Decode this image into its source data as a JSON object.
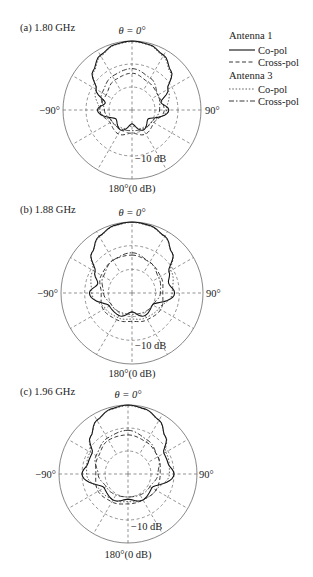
{
  "legend": {
    "groups": [
      {
        "title": "Antenna 1",
        "entries": [
          {
            "label": "Co-pol",
            "style": "solid"
          },
          {
            "label": "Cross-pol",
            "style": "dashed"
          }
        ]
      },
      {
        "title": "Antenna 3",
        "entries": [
          {
            "label": "Co-pol",
            "style": "dotted"
          },
          {
            "label": "Cross-pol",
            "style": "dash-dot"
          }
        ]
      }
    ]
  },
  "panels": [
    {
      "label": "(a) 1.80 GHz",
      "top_label": "θ = 0°",
      "left_label": "−90°",
      "right_label": "90°",
      "ring_label": "−10 dB",
      "bottom_label": "180°(0 dB)"
    },
    {
      "label": "(b) 1.88 GHz",
      "top_label": "θ = 0°",
      "left_label": "−90°",
      "right_label": "90°",
      "ring_label": "−10 dB",
      "bottom_label": "180°(0 dB)"
    },
    {
      "label": "(c) 1.96 GHz",
      "top_label": "θ = 0°",
      "left_label": "−90°",
      "right_label": "90°",
      "ring_label": "−10 dB",
      "bottom_label": "180°(0 dB)"
    }
  ],
  "chart_data": [
    {
      "type": "polar-line",
      "title": "(a) 1.80 GHz",
      "angular_axis": {
        "zero": "θ = 0° (top)",
        "ticks": [
          "0°",
          "90°",
          "180°",
          "−90°"
        ],
        "direction": "clockwise"
      },
      "radial_axis": {
        "unit": "dB",
        "outer": 0,
        "ring_labels": [
          "−10 dB"
        ],
        "rings_db": [
          0,
          -10,
          -20
        ]
      },
      "grid": true,
      "series": [
        {
          "name": "Antenna 1 Co-pol",
          "style": "solid",
          "angles_deg": [
            0,
            15,
            30,
            45,
            60,
            75,
            90,
            120,
            150,
            180,
            -150,
            -120,
            -90,
            -75,
            -60,
            -45,
            -30,
            -15
          ],
          "values_db": [
            0,
            -0.6,
            -2.5,
            -6,
            -12,
            -17,
            -14,
            -22,
            -20,
            -24,
            -20,
            -22,
            -15,
            -18,
            -12,
            -6,
            -2.5,
            -0.6
          ]
        },
        {
          "name": "Antenna 1 Cross-pol",
          "style": "dashed",
          "angles_deg": [
            0,
            30,
            60,
            90,
            120,
            150,
            180,
            -150,
            -120,
            -90,
            -60,
            -30
          ],
          "values_db": [
            -14,
            -16,
            -17,
            -16,
            -19,
            -18,
            -20,
            -18,
            -19,
            -16,
            -17,
            -15
          ]
        },
        {
          "name": "Antenna 3 Co-pol",
          "style": "dotted",
          "angles_deg": [
            0,
            15,
            30,
            45,
            60,
            90,
            120,
            150,
            180,
            -150,
            -120,
            -90,
            -60,
            -45,
            -30,
            -15
          ],
          "values_db": [
            -0.3,
            -0.8,
            -3,
            -6.5,
            -12,
            -15,
            -20,
            -21,
            -23,
            -21,
            -20,
            -16,
            -12,
            -6.5,
            -3,
            -0.8
          ]
        },
        {
          "name": "Antenna 3 Cross-pol",
          "style": "dash-dot",
          "angles_deg": [
            0,
            30,
            60,
            90,
            120,
            180,
            -120,
            -90,
            -60,
            -30
          ],
          "values_db": [
            -12,
            -14,
            -17,
            -18,
            -20,
            -21,
            -20,
            -18,
            -15,
            -13
          ]
        }
      ]
    },
    {
      "type": "polar-line",
      "title": "(b) 1.88 GHz",
      "angular_axis": {
        "zero": "θ = 0° (top)",
        "ticks": [
          "0°",
          "90°",
          "180°",
          "−90°"
        ],
        "direction": "clockwise"
      },
      "radial_axis": {
        "unit": "dB",
        "outer": 0,
        "ring_labels": [
          "−10 dB"
        ],
        "rings_db": [
          0,
          -10,
          -20
        ]
      },
      "grid": true,
      "series": [
        {
          "name": "Antenna 1 Co-pol",
          "style": "solid",
          "angles_deg": [
            0,
            15,
            30,
            45,
            60,
            75,
            90,
            120,
            150,
            180,
            -150,
            -120,
            -90,
            -75,
            -60,
            -45,
            -30,
            -15
          ],
          "values_db": [
            0,
            -0.5,
            -2.3,
            -6,
            -12,
            -14,
            -12,
            -20,
            -19,
            -22,
            -19,
            -19,
            -12,
            -15,
            -12,
            -6,
            -2.3,
            -0.5
          ]
        },
        {
          "name": "Antenna 1 Cross-pol",
          "style": "dashed",
          "angles_deg": [
            0,
            30,
            60,
            90,
            120,
            150,
            180,
            -150,
            -120,
            -90,
            -60,
            -30
          ],
          "values_db": [
            -14,
            -15,
            -16,
            -17,
            -16,
            -17,
            -18,
            -17,
            -16,
            -17,
            -15,
            -14
          ]
        },
        {
          "name": "Antenna 3 Co-pol",
          "style": "dotted",
          "angles_deg": [
            0,
            15,
            30,
            45,
            60,
            90,
            120,
            150,
            180,
            -150,
            -120,
            -90,
            -60,
            -45,
            -30,
            -15
          ],
          "values_db": [
            -0.2,
            -0.7,
            -2.6,
            -6,
            -11,
            -13,
            -17,
            -18,
            -19,
            -18,
            -17,
            -13,
            -11,
            -6,
            -2.6,
            -0.7
          ]
        },
        {
          "name": "Antenna 3 Cross-pol",
          "style": "dash-dot",
          "angles_deg": [
            0,
            30,
            60,
            90,
            120,
            180,
            -120,
            -90,
            -60,
            -30
          ],
          "values_db": [
            -13,
            -15,
            -17,
            -18,
            -20,
            -21,
            -20,
            -18,
            -16,
            -14
          ]
        }
      ]
    },
    {
      "type": "polar-line",
      "title": "(c) 1.96 GHz",
      "angular_axis": {
        "zero": "θ = 0° (top)",
        "ticks": [
          "0°",
          "90°",
          "180°",
          "−90°"
        ],
        "direction": "clockwise"
      },
      "radial_axis": {
        "unit": "dB",
        "outer": 0,
        "ring_labels": [
          "−10 dB"
        ],
        "rings_db": [
          0,
          -10,
          -20
        ]
      },
      "grid": true,
      "series": [
        {
          "name": "Antenna 1 Co-pol",
          "style": "solid",
          "angles_deg": [
            0,
            15,
            30,
            45,
            60,
            75,
            90,
            120,
            150,
            180,
            -150,
            -120,
            -90,
            -75,
            -60,
            -45,
            -30,
            -15
          ],
          "values_db": [
            0,
            -0.8,
            -3,
            -7,
            -12,
            -12,
            -10,
            -18,
            -17,
            -19,
            -17,
            -18,
            -10,
            -12,
            -12,
            -7,
            -3,
            -0.8
          ]
        },
        {
          "name": "Antenna 1 Cross-pol",
          "style": "dashed",
          "angles_deg": [
            0,
            30,
            60,
            90,
            120,
            150,
            180,
            -150,
            -120,
            -90,
            -60,
            -30
          ],
          "values_db": [
            -13,
            -14,
            -15,
            -16,
            -16,
            -17,
            -17,
            -16,
            -15,
            -16,
            -15,
            -13
          ]
        },
        {
          "name": "Antenna 3 Co-pol",
          "style": "dotted",
          "angles_deg": [
            0,
            15,
            30,
            45,
            60,
            90,
            120,
            150,
            180,
            -150,
            -120,
            -90,
            -60,
            -45,
            -30,
            -15
          ],
          "values_db": [
            -0.3,
            -1,
            -3.2,
            -7,
            -11,
            -12,
            -16,
            -17,
            -18,
            -17,
            -16,
            -12,
            -11,
            -7,
            -3.2,
            -1
          ]
        },
        {
          "name": "Antenna 3 Cross-pol",
          "style": "dash-dot",
          "angles_deg": [
            0,
            30,
            60,
            90,
            120,
            180,
            -120,
            -90,
            -60,
            -30
          ],
          "values_db": [
            -11,
            -13,
            -15,
            -17,
            -19,
            -20,
            -19,
            -17,
            -14,
            -12
          ]
        }
      ]
    }
  ]
}
